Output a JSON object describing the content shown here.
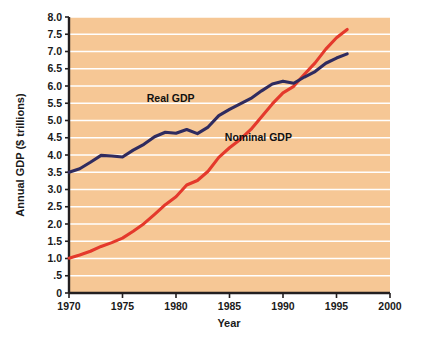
{
  "chart_data": {
    "type": "line",
    "title": "",
    "xlabel": "Year",
    "ylabel": "Annual GDP ($ trillions)",
    "xlim": [
      1970,
      2000
    ],
    "ylim": [
      0,
      8.0
    ],
    "grid": "horizontal",
    "legend_position": "inline-annotations",
    "background_color": "#f6c795",
    "gridline_color": "#ffffff",
    "x_ticks": [
      "1970",
      "1975",
      "1980",
      "1985",
      "1990",
      "1995",
      "2000"
    ],
    "x_tick_values": [
      1970,
      1975,
      1980,
      1985,
      1990,
      1995,
      2000
    ],
    "y_ticks": [
      "0",
      ".5",
      "1.0",
      "1.5",
      "2.0",
      "2.5",
      "3.0",
      "3.5",
      "4.0",
      "4.5",
      "5.0",
      "5.5",
      "6.0",
      "6.5",
      "7.0",
      "7.5",
      "8.0"
    ],
    "y_tick_values": [
      0,
      0.5,
      1.0,
      1.5,
      2.0,
      2.5,
      3.0,
      3.5,
      4.0,
      4.5,
      5.0,
      5.5,
      6.0,
      6.5,
      7.0,
      7.5,
      8.0
    ],
    "x": [
      1970,
      1971,
      1972,
      1973,
      1974,
      1975,
      1976,
      1977,
      1978,
      1979,
      1980,
      1981,
      1982,
      1983,
      1984,
      1985,
      1986,
      1987,
      1988,
      1989,
      1990,
      1991,
      1992,
      1993,
      1994,
      1995,
      1996
    ],
    "series": [
      {
        "name": "Real GDP",
        "color": "#2f2b5f",
        "label_x": 1979.5,
        "label_y": 5.55,
        "values": [
          3.5,
          3.6,
          3.79,
          3.99,
          3.97,
          3.94,
          4.14,
          4.31,
          4.53,
          4.66,
          4.63,
          4.74,
          4.62,
          4.81,
          5.14,
          5.32,
          5.48,
          5.64,
          5.86,
          6.06,
          6.14,
          6.08,
          6.26,
          6.42,
          6.66,
          6.81,
          6.93
        ],
        "axis_units": "trillions of chained dollars"
      },
      {
        "name": "Nominal GDP",
        "color": "#e4392c",
        "label_x": 1987.7,
        "label_y": 4.4,
        "values": [
          1.01,
          1.1,
          1.21,
          1.35,
          1.46,
          1.59,
          1.79,
          2.01,
          2.28,
          2.56,
          2.79,
          3.13,
          3.26,
          3.53,
          3.93,
          4.21,
          4.45,
          4.74,
          5.11,
          5.48,
          5.8,
          5.99,
          6.34,
          6.67,
          7.07,
          7.4,
          7.64
        ],
        "axis_units": "trillions of current dollars"
      }
    ]
  },
  "axis": {
    "y_title": "Annual GDP ($ trillions)",
    "x_title": "Year"
  },
  "labels": {
    "real_gdp": "Real GDP",
    "nominal_gdp": "Nominal GDP"
  }
}
